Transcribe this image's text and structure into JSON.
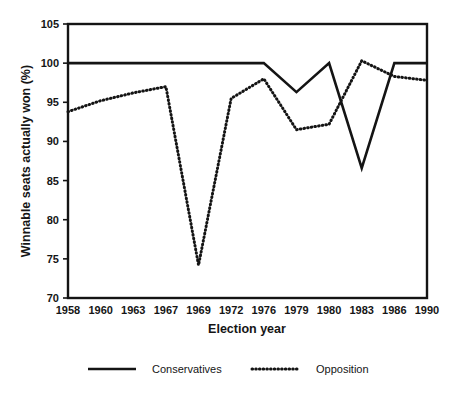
{
  "chart_data": {
    "type": "line",
    "title": "",
    "xlabel": "Election year",
    "ylabel": "Winnable seats actually won (%)",
    "categories": [
      "1958",
      "1960",
      "1963",
      "1967",
      "1969",
      "1972",
      "1976",
      "1979",
      "1980",
      "1983",
      "1986",
      "1990"
    ],
    "x_tick_labels": [
      "1958",
      "1960",
      "1963",
      "1967",
      "1969",
      "1972",
      "1976",
      "1979",
      "1980",
      "1983",
      "1986",
      "1990"
    ],
    "y_tick_labels": [
      "70",
      "75",
      "80",
      "85",
      "90",
      "95",
      "100",
      "105"
    ],
    "y_ticks": [
      70,
      75,
      80,
      85,
      90,
      95,
      100,
      105
    ],
    "ylim": [
      70,
      105
    ],
    "grid": false,
    "legend_position": "bottom",
    "series": [
      {
        "name": "Conservatives",
        "style": "solid",
        "color": "#141414",
        "values": [
          100,
          100,
          100,
          100,
          100,
          100,
          100,
          96.3,
          100,
          86.6,
          100,
          100
        ]
      },
      {
        "name": "Opposition",
        "style": "dotted",
        "color": "#141414",
        "values": [
          93.8,
          95.2,
          96.2,
          97.0,
          74.2,
          95.5,
          98.0,
          91.5,
          92.2,
          100.3,
          98.3,
          97.8
        ]
      }
    ]
  },
  "legend": {
    "items": [
      {
        "label": "Conservatives",
        "style": "solid"
      },
      {
        "label": "Opposition",
        "style": "dotted"
      }
    ]
  },
  "axes": {
    "x_title": "Election year",
    "y_title": "Winnable seats actually won (%)"
  }
}
